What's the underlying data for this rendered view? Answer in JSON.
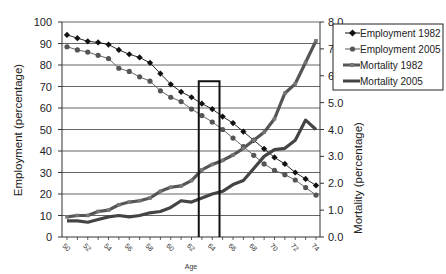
{
  "chart_data": {
    "type": "line",
    "title": "",
    "xlabel": "Age",
    "ylabel": "Employment (percentage)",
    "y2label": "Mortality (percentage)",
    "ylim": [
      0,
      100
    ],
    "y2lim": [
      0.0,
      8.0
    ],
    "yticks": [
      "0",
      "10",
      "20",
      "30",
      "40",
      "50",
      "60",
      "70",
      "80",
      "90",
      "100"
    ],
    "y2ticks": [
      "0.0",
      "1.0",
      "2.0",
      "3.0",
      "4.0",
      "5.0",
      "6.0",
      "7.0",
      "8.0"
    ],
    "x": [
      50,
      51,
      52,
      53,
      54,
      55,
      56,
      57,
      58,
      59,
      60,
      61,
      62,
      63,
      64,
      65,
      66,
      67,
      68,
      69,
      70,
      71,
      72,
      73,
      74
    ],
    "xtick_labels": [
      "50",
      "52",
      "54",
      "56",
      "58",
      "60",
      "62",
      "64",
      "66",
      "68",
      "70",
      "72",
      "74"
    ],
    "grid": true,
    "legend_position": "upper right (outside plot)",
    "series": [
      {
        "name": "Employment 1982",
        "axis": "left",
        "marker": "diamond",
        "color": "#111111",
        "values": [
          94,
          92.5,
          91,
          90.5,
          89.5,
          87,
          85,
          83.5,
          81,
          76,
          71,
          67.5,
          65,
          62,
          59.5,
          56,
          53,
          49,
          45,
          41,
          37,
          34,
          30,
          27,
          24
        ]
      },
      {
        "name": "Employment 2005",
        "axis": "left",
        "marker": "circle",
        "color": "#555555",
        "values": [
          88.5,
          87,
          86,
          84.5,
          83,
          78.5,
          77,
          74.5,
          72.5,
          68,
          65,
          63,
          59.5,
          56.5,
          53.5,
          50,
          46,
          42,
          38,
          34,
          31,
          29,
          26.5,
          23,
          19.5
        ]
      },
      {
        "name": "Mortality 1982",
        "axis": "right",
        "marker": "square",
        "color": "#555555",
        "values": [
          0.75,
          0.8,
          0.8,
          0.95,
          1.0,
          1.2,
          1.3,
          1.35,
          1.45,
          1.7,
          1.85,
          1.9,
          2.1,
          2.5,
          2.7,
          2.85,
          3.05,
          3.3,
          3.6,
          3.9,
          4.4,
          5.35,
          5.7,
          6.5,
          7.3
        ]
      },
      {
        "name": "Mortality 2005",
        "axis": "right",
        "marker": "none",
        "color": "#444444",
        "values": [
          0.6,
          0.6,
          0.55,
          0.65,
          0.75,
          0.8,
          0.75,
          0.8,
          0.9,
          0.95,
          1.1,
          1.35,
          1.3,
          1.45,
          1.6,
          1.7,
          1.95,
          2.1,
          2.55,
          3.0,
          3.25,
          3.3,
          3.6,
          4.35,
          4.0
        ]
      }
    ],
    "annotations": [
      {
        "type": "rectangle",
        "x_start": 62.7,
        "x_end": 64.7,
        "y_top": 72.5,
        "description": "outlined box highlighting ages ~63-64"
      }
    ]
  },
  "legend": {
    "items": [
      {
        "label": "Employment 1982"
      },
      {
        "label": "Employment 2005"
      },
      {
        "label": "Mortality 1982"
      },
      {
        "label": "Mortality 2005"
      }
    ]
  },
  "axes": {
    "left_title": "Employment (percentage)",
    "right_title": "Mortality (percentage)",
    "x_title": "Age"
  }
}
